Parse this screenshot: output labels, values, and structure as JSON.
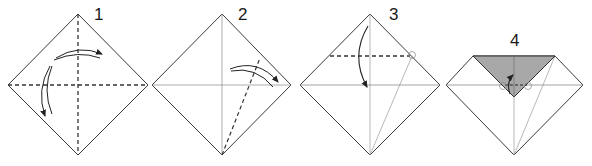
{
  "diagram": {
    "type": "origami instructions",
    "steps": [
      {
        "number": "1",
        "description": "Square rotated as diamond; fold in half both ways (valley folds along both diagonals), then unfold",
        "folds": [
          "vertical dashed valley fold",
          "horizontal dashed valley fold"
        ],
        "arrows": [
          "curved fold-and-unfold arrow over top",
          "curved fold-and-unfold arrow on left"
        ]
      },
      {
        "number": "2",
        "description": "Fold the bottom-right edge to the center crease; dashed valley line from bottom corner toward right edge",
        "folds": [
          "diagonal dashed valley fold from bottom corner"
        ],
        "arrows": [
          "curved fold-and-unfold arrow toward right corner"
        ]
      },
      {
        "number": "3",
        "description": "Fold top corner down along horizontal dashed line where crease meets edge (circled reference point)",
        "folds": [
          "horizontal dashed valley fold across upper part"
        ],
        "arrows": [
          "curved arrow from top corner down to center"
        ],
        "reference_points": [
          "circle at right end of dashed line"
        ]
      },
      {
        "number": "4",
        "description": "Top corner folded down forming gray triangle; fold the tip back up along small dashed line",
        "folds": [
          "short horizontal dashed fold at center"
        ],
        "arrows": [
          "small curved arrow pointing up"
        ],
        "reference_points": [
          "circle at left of dashed line",
          "circle at right of dashed line"
        ],
        "shaded_region": "folded-down top flap (back side of paper)"
      }
    ]
  },
  "colors": {
    "line": "#3a3a3a",
    "crease": "#9a9a9a",
    "fill_back": "#a8a8a8",
    "paper": "#ffffff"
  }
}
